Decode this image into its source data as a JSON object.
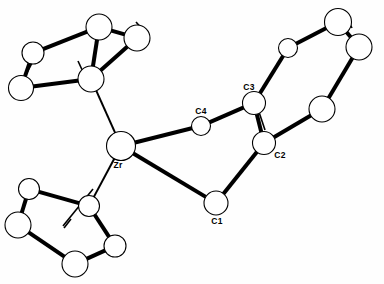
{
  "figure": {
    "background_color": "#fefefe",
    "line_color": "#000000",
    "atom_fill_color": "#ffffff",
    "width": 384,
    "height": 284
  },
  "labels": {
    "zr": "Zr",
    "c1": "C1",
    "c2": "C2",
    "c3": "C3",
    "c4": "C4"
  },
  "atoms": [
    {
      "id": "zr",
      "label": "Zr",
      "x": 121,
      "y": 146,
      "r": 14.5,
      "labeled": true,
      "label_dx": -3,
      "label_dy": 20
    },
    {
      "id": "c1",
      "label": "C1",
      "x": 216,
      "y": 203,
      "r": 12.0,
      "labeled": true,
      "label_dx": 1,
      "label_dy": 19
    },
    {
      "id": "c2",
      "label": "C2",
      "x": 264,
      "y": 143,
      "r": 11.5,
      "labeled": true,
      "label_dx": 16,
      "label_dy": 13
    },
    {
      "id": "c3",
      "label": "C3",
      "x": 254,
      "y": 103,
      "r": 11.5,
      "labeled": true,
      "label_dx": -5,
      "label_dy": -15
    },
    {
      "id": "c4",
      "label": "C4",
      "x": 201,
      "y": 126,
      "r": 9.5,
      "labeled": true,
      "label_dx": 0,
      "label_dy": -14
    },
    {
      "id": "r6a",
      "label": "",
      "x": 288,
      "y": 48,
      "r": 9.5,
      "labeled": false
    },
    {
      "id": "r6b",
      "label": "",
      "x": 338,
      "y": 22,
      "r": 13.5,
      "labeled": false
    },
    {
      "id": "r6c",
      "label": "",
      "x": 359,
      "y": 47,
      "r": 13.0,
      "labeled": false
    },
    {
      "id": "r6d",
      "label": "",
      "x": 322,
      "y": 109,
      "r": 13.0,
      "labeled": false
    },
    {
      "id": "cpA0",
      "label": "",
      "x": 91,
      "y": 79,
      "r": 13.0,
      "labeled": false
    },
    {
      "id": "cpA1",
      "label": "",
      "x": 99,
      "y": 27,
      "r": 13.0,
      "labeled": false
    },
    {
      "id": "cpA2",
      "label": "",
      "x": 137,
      "y": 38,
      "r": 13.0,
      "labeled": false
    },
    {
      "id": "cpA3",
      "label": "",
      "x": 33,
      "y": 53,
      "r": 11.0,
      "labeled": false
    },
    {
      "id": "cpA4",
      "label": "",
      "x": 21,
      "y": 88,
      "r": 12.5,
      "labeled": false
    },
    {
      "id": "cpB0",
      "label": "",
      "x": 89,
      "y": 206,
      "r": 10.5,
      "labeled": false
    },
    {
      "id": "cpB1",
      "label": "",
      "x": 29,
      "y": 189,
      "r": 10.5,
      "labeled": false
    },
    {
      "id": "cpB2",
      "label": "",
      "x": 18,
      "y": 225,
      "r": 13.0,
      "labeled": false
    },
    {
      "id": "cpB3",
      "label": "",
      "x": 75,
      "y": 264,
      "r": 13.0,
      "labeled": false
    },
    {
      "id": "cpB4",
      "label": "",
      "x": 115,
      "y": 246,
      "r": 11.0,
      "labeled": false
    }
  ],
  "bonds": [
    {
      "from": "zr",
      "to": "c4",
      "width": 4.0
    },
    {
      "from": "zr",
      "to": "c1",
      "width": 4.0
    },
    {
      "from": "c4",
      "to": "c3",
      "width": 4.0
    },
    {
      "from": "c3",
      "to": "c2",
      "width": 4.0
    },
    {
      "from": "c2",
      "to": "c1",
      "width": 4.0
    },
    {
      "from": "c3",
      "to": "r6a",
      "width": 4.0
    },
    {
      "from": "r6a",
      "to": "r6b",
      "width": 4.0
    },
    {
      "from": "r6b",
      "to": "r6c",
      "width": 4.0
    },
    {
      "from": "r6c",
      "to": "r6d",
      "width": 4.0
    },
    {
      "from": "r6d",
      "to": "c2",
      "width": 4.0
    },
    {
      "from": "zr",
      "to": "cpA0",
      "width": 2.0
    },
    {
      "from": "cpA0",
      "to": "cpA1",
      "width": 4.0
    },
    {
      "from": "cpA0",
      "to": "cpA2",
      "width": 4.0
    },
    {
      "from": "cpA1",
      "to": "cpA3",
      "width": 4.0
    },
    {
      "from": "cpA2",
      "to": "cpA1",
      "width": 4.0
    },
    {
      "from": "cpA3",
      "to": "cpA4",
      "width": 4.0
    },
    {
      "from": "cpA4",
      "to": "cpA0",
      "width": 4.0
    },
    {
      "from": "zr",
      "to": "cpB0",
      "width": 2.0
    },
    {
      "from": "cpB0",
      "to": "cpB1",
      "width": 4.0
    },
    {
      "from": "cpB1",
      "to": "cpB2",
      "width": 4.0
    },
    {
      "from": "cpB2",
      "to": "cpB3",
      "width": 4.0
    },
    {
      "from": "cpB3",
      "to": "cpB4",
      "width": 4.0
    },
    {
      "from": "cpB4",
      "to": "cpB0",
      "width": 4.0
    }
  ],
  "substituent_stubs": [
    {
      "x1": 78,
      "y1": 61,
      "x2": 84,
      "y2": 74
    },
    {
      "x1": 32,
      "y1": 63,
      "x2": 24,
      "y2": 78
    },
    {
      "x1": 136,
      "y1": 22,
      "x2": 145,
      "y2": 32
    },
    {
      "x1": 71,
      "y1": 219,
      "x2": 64,
      "y2": 228
    },
    {
      "x1": 344,
      "y1": 12,
      "x2": 352,
      "y2": 28
    },
    {
      "x1": 93,
      "y1": 189,
      "x2": 63,
      "y2": 226
    },
    {
      "x1": 259,
      "y1": 112,
      "x2": 265,
      "y2": 130
    }
  ]
}
